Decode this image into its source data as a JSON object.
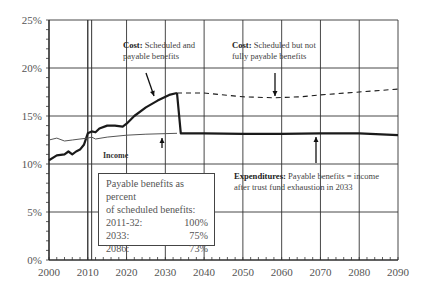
{
  "chart_data": {
    "type": "line",
    "title": "",
    "xlabel": "",
    "ylabel": "",
    "xlim": [
      2000,
      2090
    ],
    "ylim": [
      0,
      25
    ],
    "x_ticks": [
      2000,
      2010,
      2020,
      2030,
      2040,
      2050,
      2060,
      2070,
      2080,
      2090
    ],
    "y_ticks": [
      "0%",
      "5%",
      "10%",
      "15%",
      "20%",
      "25%"
    ],
    "grid": true,
    "series": [
      {
        "name": "Cost: Scheduled and payable benefits",
        "style": "solid-bold",
        "x": [
          2000,
          2002,
          2004,
          2005,
          2006,
          2007,
          2008,
          2009,
          2010,
          2011,
          2012,
          2013,
          2015,
          2017,
          2019,
          2020,
          2022,
          2025,
          2028,
          2031,
          2033
        ],
        "y": [
          10.4,
          10.9,
          11.0,
          11.3,
          11.0,
          11.3,
          11.5,
          12.0,
          13.2,
          13.4,
          13.3,
          13.7,
          14.0,
          14.0,
          13.9,
          14.2,
          15.0,
          15.9,
          16.6,
          17.2,
          17.4
        ]
      },
      {
        "name": "Expenditures: Payable benefits = income after trust fund exhaustion in 2033",
        "style": "solid-bold",
        "x": [
          2033,
          2034,
          2040,
          2050,
          2060,
          2070,
          2080,
          2090
        ],
        "y": [
          17.4,
          13.2,
          13.2,
          13.15,
          13.15,
          13.2,
          13.2,
          13.0
        ]
      },
      {
        "name": "Cost: Scheduled but not fully payable benefits",
        "style": "dashed",
        "x": [
          2033,
          2040,
          2050,
          2058,
          2065,
          2070,
          2080,
          2090
        ],
        "y": [
          17.4,
          17.4,
          17.0,
          16.9,
          17.0,
          17.2,
          17.5,
          17.8
        ]
      },
      {
        "name": "Income",
        "style": "solid-thin",
        "x": [
          2000,
          2002,
          2004,
          2006,
          2008,
          2010,
          2011,
          2012,
          2015,
          2020,
          2025,
          2033
        ],
        "y": [
          12.5,
          12.7,
          12.4,
          12.5,
          12.6,
          12.7,
          12.8,
          12.6,
          12.8,
          13.0,
          13.1,
          13.2
        ]
      }
    ],
    "reference_lines": [
      {
        "x": 2010,
        "note": "double vertical line"
      },
      {
        "x": 2011
      }
    ],
    "annotations": [
      {
        "bold": "Cost:",
        "text": "Scheduled and payable benefits",
        "x": 2022,
        "y": 17.4
      },
      {
        "bold": "Cost:",
        "text": "Scheduled but not fully payable benefits",
        "x": 2058,
        "y": 16.9
      },
      {
        "bold": "Income",
        "text": "",
        "x": 2029,
        "y": 13.1
      },
      {
        "bold": "Expenditures:",
        "text": "Payable benefits = income after trust fund exhaustion in 2033",
        "x": 2069,
        "y": 13.2
      }
    ],
    "legend_table": {
      "title": "Payable benefits as percent of scheduled benefits:",
      "rows": [
        {
          "period": "2011-32:",
          "value": "100%"
        },
        {
          "period": "2033:",
          "value": "75%"
        },
        {
          "period": "2086:",
          "value": "73%"
        }
      ]
    }
  },
  "annotations": {
    "cost_payable_bold": "Cost:",
    "cost_payable_line1": " Scheduled and",
    "cost_payable_line2": "payable benefits",
    "cost_unpayable_bold": "Cost:",
    "cost_unpayable_line1": " Scheduled but not",
    "cost_unpayable_line2": "fully payable benefits",
    "income": "Income",
    "expend_bold": "Expenditures:",
    "expend_line1": " Payable benefits = income",
    "expend_line2": "after trust fund exhaustion in 2033"
  },
  "legend": {
    "title_line1": "Payable benefits as percent",
    "title_line2": "of scheduled benefits:",
    "rows": [
      {
        "period": "2011-32:",
        "value": "100%"
      },
      {
        "period": "2033:",
        "value": "75%"
      },
      {
        "period": "2086:",
        "value": "73%"
      }
    ]
  },
  "colors": {
    "bold_line": "#1a1a1a",
    "income_line": "#555555",
    "grid": "#333333",
    "text": "#555555"
  }
}
